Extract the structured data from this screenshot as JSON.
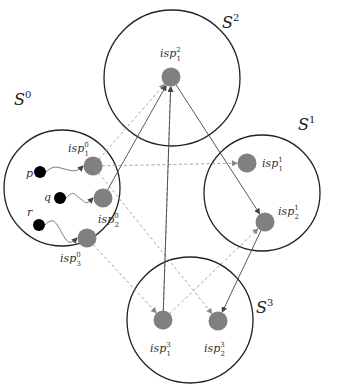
{
  "diagram": {
    "sets": [
      {
        "id": "S0",
        "label": "S",
        "sup": "0",
        "cx": 62,
        "cy": 188,
        "r": 58,
        "lx": 14,
        "ly": 105
      },
      {
        "id": "S1",
        "label": "S",
        "sup": "1",
        "cx": 262,
        "cy": 193,
        "r": 58,
        "lx": 298,
        "ly": 130
      },
      {
        "id": "S2",
        "label": "S",
        "sup": "2",
        "cx": 172,
        "cy": 78,
        "r": 68,
        "lx": 222,
        "ly": 28
      },
      {
        "id": "S3",
        "label": "S",
        "sup": "3",
        "cx": 190,
        "cy": 320,
        "r": 63,
        "lx": 256,
        "ly": 313
      }
    ],
    "isp_nodes": [
      {
        "id": "isp01",
        "label": "isp",
        "sub": "1",
        "sup": "0",
        "x": 93,
        "y": 166,
        "lx": 68,
        "ly": 152
      },
      {
        "id": "isp02",
        "label": "isp",
        "sub": "2",
        "sup": "0",
        "x": 103,
        "y": 198,
        "lx": 98,
        "ly": 223
      },
      {
        "id": "isp03",
        "label": "isp",
        "sub": "3",
        "sup": "0",
        "x": 87,
        "y": 238,
        "lx": 60,
        "ly": 262
      },
      {
        "id": "isp11",
        "label": "isp",
        "sub": "1",
        "sup": "1",
        "x": 247,
        "y": 163,
        "lx": 262,
        "ly": 167
      },
      {
        "id": "isp12",
        "label": "isp",
        "sub": "2",
        "sup": "1",
        "x": 265,
        "y": 222,
        "lx": 278,
        "ly": 215
      },
      {
        "id": "isp21",
        "label": "isp",
        "sub": "1",
        "sup": "2",
        "x": 171,
        "y": 77,
        "lx": 160,
        "ly": 57
      },
      {
        "id": "isp31",
        "label": "isp",
        "sub": "1",
        "sup": "3",
        "x": 163,
        "y": 320,
        "lx": 150,
        "ly": 352
      },
      {
        "id": "isp32",
        "label": "isp",
        "sub": "2",
        "sup": "3",
        "x": 218,
        "y": 321,
        "lx": 204,
        "ly": 352
      }
    ],
    "peers": [
      {
        "id": "p",
        "label": "p",
        "x": 40,
        "y": 172,
        "lx": 26,
        "ly": 177
      },
      {
        "id": "q",
        "label": "q",
        "x": 60,
        "y": 198,
        "lx": 44,
        "ly": 201
      },
      {
        "id": "r",
        "label": "r",
        "x": 39,
        "y": 225,
        "lx": 27,
        "ly": 216
      }
    ],
    "peer_links": [
      {
        "from": "p",
        "to": "isp01"
      },
      {
        "from": "q",
        "to": "isp02"
      },
      {
        "from": "r",
        "to": "isp03"
      }
    ],
    "solid_edges": [
      {
        "from": "isp02",
        "to": "isp21"
      },
      {
        "from": "isp21",
        "to": "isp12"
      },
      {
        "from": "isp12",
        "to": "isp32"
      },
      {
        "from": "isp31",
        "to": "isp21"
      }
    ],
    "dashed_edges": [
      {
        "from": "isp01",
        "to": "isp21"
      },
      {
        "from": "isp01",
        "to": "isp11"
      },
      {
        "from": "isp01",
        "to": "isp32"
      },
      {
        "from": "isp03",
        "to": "isp31"
      },
      {
        "from": "isp31",
        "to": "isp21"
      },
      {
        "from": "isp31",
        "to": "isp12"
      }
    ],
    "colors": {
      "isp_fill": "#808080",
      "peer_fill": "#000000",
      "circle_stroke": "#222222",
      "edge_solid": "#444444",
      "edge_dashed": "#999999"
    }
  }
}
